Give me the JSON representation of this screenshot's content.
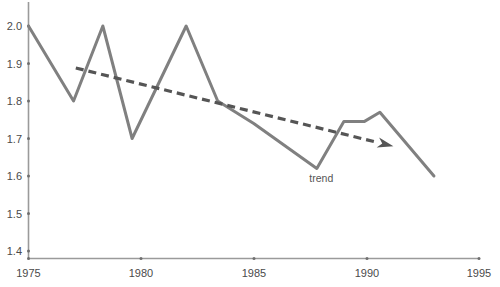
{
  "chart_data": {
    "type": "line",
    "title": "",
    "xlabel": "",
    "ylabel": "",
    "xlim": [
      1975,
      1995
    ],
    "ylim": [
      1.35,
      2.02
    ],
    "grid": false,
    "legend": "none",
    "xticks": [
      "1975",
      "1980",
      "1985",
      "1990",
      "1995"
    ],
    "xtick_values": [
      1975,
      1980,
      1985,
      1990,
      1995
    ],
    "yticks": [
      "1.4",
      "1.5",
      "1.6",
      "1.7",
      "1.8",
      "1.9",
      "2.0"
    ],
    "ytick_values": [
      1.4,
      1.5,
      1.6,
      1.7,
      1.8,
      1.9,
      2.0
    ],
    "series": [
      {
        "name": "data",
        "style": "solid",
        "color": "#808080",
        "x": [
          1975.0,
          1977.0,
          1978.3,
          1979.6,
          1982.0,
          1983.4,
          1985.0,
          1987.8,
          1989.0,
          1989.9,
          1990.6,
          1993.0
        ],
        "values": [
          2.0,
          1.8,
          2.0,
          1.7,
          2.0,
          1.8,
          1.74,
          1.62,
          1.745,
          1.745,
          1.77,
          1.6
        ]
      },
      {
        "name": "trend",
        "style": "dashed",
        "color": "#555555",
        "label": "trend",
        "arrow": true,
        "x": [
          1977.1,
          1991.2
        ],
        "values": [
          1.888,
          1.679
        ]
      }
    ],
    "annotations": [
      {
        "text": "trend",
        "x": 1988.0,
        "y": 1.585
      }
    ],
    "colors": {
      "data_line": "#808080",
      "trend_line": "#555555",
      "axis": "#9a9a9a",
      "tick_label": "#4a4a4a",
      "annotation": "#555555",
      "background": "#ffffff"
    }
  }
}
